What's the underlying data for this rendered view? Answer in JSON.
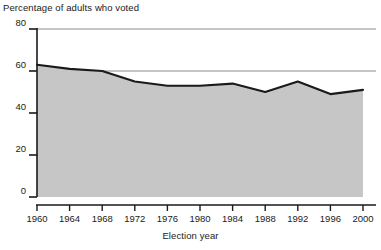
{
  "chart_data": {
    "type": "area",
    "title": "Percentage of adults who voted",
    "xlabel": "Election year",
    "ylabel": "",
    "categories": [
      "1960",
      "1964",
      "1968",
      "1972",
      "1976",
      "1980",
      "1984",
      "1988",
      "1992",
      "1996",
      "2000"
    ],
    "values": [
      63,
      61,
      60,
      55,
      53,
      53,
      54,
      50,
      55,
      49,
      51
    ],
    "series": [
      {
        "name": "Percentage of adults who voted",
        "values": [
          63,
          61,
          60,
          55,
          53,
          53,
          54,
          50,
          55,
          49,
          51
        ]
      }
    ],
    "x": [
      1960,
      1964,
      1968,
      1972,
      1976,
      1980,
      1984,
      1988,
      1992,
      1996,
      2000
    ],
    "ylim": [
      0,
      80
    ],
    "xlim": [
      1960,
      2000
    ],
    "yticks": [
      0,
      20,
      40,
      60,
      80
    ],
    "ytick_labels": [
      "0",
      "20",
      "40",
      "60",
      "80"
    ],
    "xticks": [
      1960,
      1964,
      1968,
      1972,
      1976,
      1980,
      1984,
      1988,
      1992,
      1996,
      2000
    ],
    "xtick_labels": [
      "1960",
      "1964",
      "1968",
      "1972",
      "1976",
      "1980",
      "1984",
      "1988",
      "1992",
      "1996",
      "2000"
    ],
    "grid": true,
    "gridlines_at": [
      60,
      80
    ],
    "legend": null,
    "legend_position": "none",
    "colors": {
      "area_fill": "#c6c6c6",
      "line": "#1a1a1a",
      "axis": "#1a1a1a",
      "gridline": "#8c8c8c",
      "text": "#1a1a1a",
      "background": "#ffffff"
    }
  },
  "labels": {
    "title": "Percentage of adults who voted",
    "xlabel": "Election year"
  }
}
